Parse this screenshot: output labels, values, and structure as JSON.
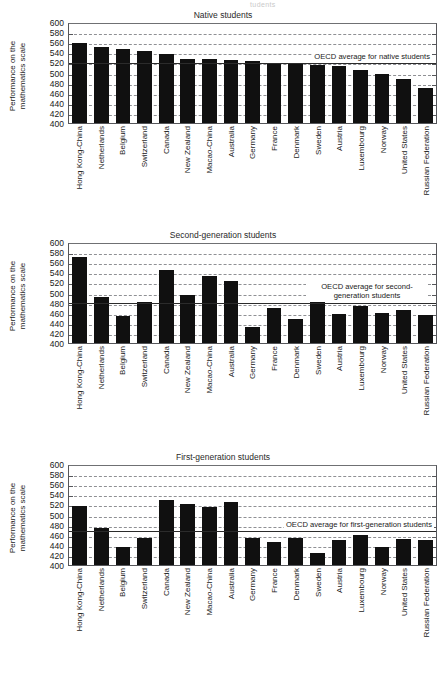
{
  "ghost_top_text": "tudents",
  "axis": {
    "y_title_line1": "Performance on the",
    "y_title_line2": "mathematics scale",
    "ticks": [
      600,
      580,
      560,
      540,
      520,
      500,
      480,
      460,
      440,
      420,
      400
    ],
    "ymin": 400,
    "ymax": 600
  },
  "categories": [
    "Hong Kong-China",
    "Netherlands",
    "Belgium",
    "Switzerland",
    "Canada",
    "New Zealand",
    "Macao-China",
    "Australia",
    "Germany",
    "France",
    "Denmark",
    "Sweden",
    "Austria",
    "Luxembourg",
    "Norway",
    "United States",
    "Russian Federation"
  ],
  "panels": [
    {
      "title": "Native students",
      "avg_label": "OECD average for native students",
      "avg_label_lines": 1,
      "avg_value": 523,
      "values": [
        558,
        551,
        546,
        543,
        537,
        526,
        526,
        524,
        522,
        518,
        517,
        515,
        512,
        505,
        497,
        487,
        469
      ]
    },
    {
      "title": "Second-generation students",
      "avg_label": "OECD average for second-generation students",
      "avg_label_lines": 2,
      "avg_value": 483,
      "values": [
        571,
        492,
        454,
        482,
        544,
        496,
        532,
        522,
        432,
        470,
        448,
        481,
        457,
        473,
        459,
        465,
        455
      ]
    },
    {
      "title": "First-generation students",
      "avg_label": "OECD average for first-generation students",
      "avg_label_lines": 1,
      "avg_value": 472,
      "values": [
        517,
        474,
        436,
        453,
        529,
        521,
        515,
        524,
        453,
        446,
        454,
        423,
        450,
        460,
        436,
        451,
        449
      ]
    }
  ],
  "chart_data": {
    "type": "bar",
    "xlabel": "",
    "ylabel": "Performance on the mathematics scale",
    "ylim": [
      400,
      600
    ],
    "ytick_step": 20,
    "grid": true,
    "legend": "none",
    "categories": [
      "Hong Kong-China",
      "Netherlands",
      "Belgium",
      "Switzerland",
      "Canada",
      "New Zealand",
      "Macao-China",
      "Australia",
      "Germany",
      "France",
      "Denmark",
      "Sweden",
      "Austria",
      "Luxembourg",
      "Norway",
      "United States",
      "Russian Federation"
    ],
    "series": [
      {
        "name": "Native students",
        "values": [
          558,
          551,
          546,
          543,
          537,
          526,
          526,
          524,
          522,
          518,
          517,
          515,
          512,
          505,
          497,
          487,
          469
        ],
        "annotation": "OECD average for native students",
        "reference_line": 523
      },
      {
        "name": "Second-generation students",
        "values": [
          571,
          492,
          454,
          482,
          544,
          496,
          532,
          522,
          432,
          470,
          448,
          481,
          457,
          473,
          459,
          465,
          455
        ],
        "annotation": "OECD average for second-generation students",
        "reference_line": 483
      },
      {
        "name": "First-generation students",
        "values": [
          517,
          474,
          436,
          453,
          529,
          521,
          515,
          524,
          453,
          446,
          454,
          423,
          450,
          460,
          436,
          451,
          449
        ],
        "annotation": "OECD average for first-generation students",
        "reference_line": 472
      }
    ]
  }
}
